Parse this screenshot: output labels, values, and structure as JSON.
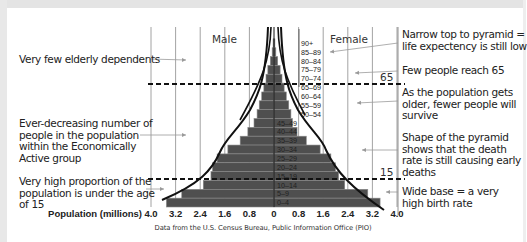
{
  "chart_data": {
    "type": "bar",
    "subtype": "population-pyramid",
    "title": "",
    "xlabel": "Population (millions)",
    "ylabel": "",
    "x_ticks_left": [
      "4.0",
      "3.2",
      "2.4",
      "1.6",
      "0.8",
      "0"
    ],
    "x_ticks_right": [
      "0.8",
      "1.6",
      "2.4",
      "3.2",
      "4.0"
    ],
    "xlim": [
      0,
      4.0
    ],
    "grid": true,
    "categories": [
      "90+",
      "85–89",
      "80–84",
      "75–79",
      "70–74",
      "65–69",
      "60–64",
      "55–59",
      "50–54",
      "45–49",
      "40–44",
      "35–39",
      "30–34",
      "25–29",
      "20–24",
      "15–19",
      "10–14",
      "5–9",
      "0–4"
    ],
    "series": [
      {
        "name": "Male",
        "values": [
          0.03,
          0.06,
          0.12,
          0.2,
          0.26,
          0.33,
          0.4,
          0.48,
          0.55,
          0.65,
          0.85,
          1.1,
          1.5,
          1.85,
          2.0,
          2.05,
          2.3,
          3.0,
          3.5
        ]
      },
      {
        "name": "Female",
        "values": [
          0.03,
          0.06,
          0.12,
          0.2,
          0.26,
          0.33,
          0.4,
          0.48,
          0.55,
          0.6,
          0.75,
          1.05,
          1.5,
          1.85,
          2.0,
          2.1,
          2.3,
          3.05,
          3.45
        ]
      }
    ],
    "reference_lines": [
      {
        "label": "65",
        "age_boundary": "65"
      },
      {
        "label": "15",
        "age_boundary": "15"
      }
    ],
    "annotations_left": [
      "Very few elderly dependents",
      "Ever-decreasing number of people in the population within the Economically Active group",
      "Very high proportion of the population is under the age of 15"
    ],
    "annotations_right": [
      "Narrow top to pyramid = life expectency is still low",
      "Few people reach 65",
      "As the population gets older, fewer people will survive",
      "Shape of the pyramid shows that the death rate is still causing early deaths",
      "Wide base = a very high birth rate"
    ],
    "source": "Data from the U.S. Census Bureau, Public Information Office (PIO)"
  },
  "labels": {
    "male": "Male",
    "female": "Female",
    "xlabel": "Population (millions)",
    "line65": "65",
    "line15": "15",
    "source": "Data from the U.S. Census Bureau, Public Information Office (PIO)"
  },
  "notes_left": [
    {
      "lines": [
        "Very few elderly dependents"
      ]
    },
    {
      "lines": [
        "Ever-decreasing number of",
        "people in the population",
        "within the Economically",
        "Active group"
      ]
    },
    {
      "lines": [
        "Very high proportion of the",
        "population is under the age",
        "of 15"
      ]
    }
  ],
  "notes_right": [
    {
      "lines": [
        "Narrow top to pyramid =",
        "life expectency is still low"
      ]
    },
    {
      "lines": [
        "Few people reach 65"
      ]
    },
    {
      "lines": [
        "As the population gets",
        "older, fewer people will",
        "survive"
      ]
    },
    {
      "lines": [
        "Shape of the pyramid",
        "shows that the death",
        "rate is still causing early",
        "deaths"
      ]
    },
    {
      "lines": [
        "Wide base = a very",
        "high birth rate"
      ]
    }
  ],
  "colors": {
    "bar": "#4f4f4f",
    "bar_edge": "#8a8a8a",
    "grid": "#8c8c8c",
    "curve": "#111111",
    "dash": "#111111",
    "arrow": "#9a9a9a"
  }
}
